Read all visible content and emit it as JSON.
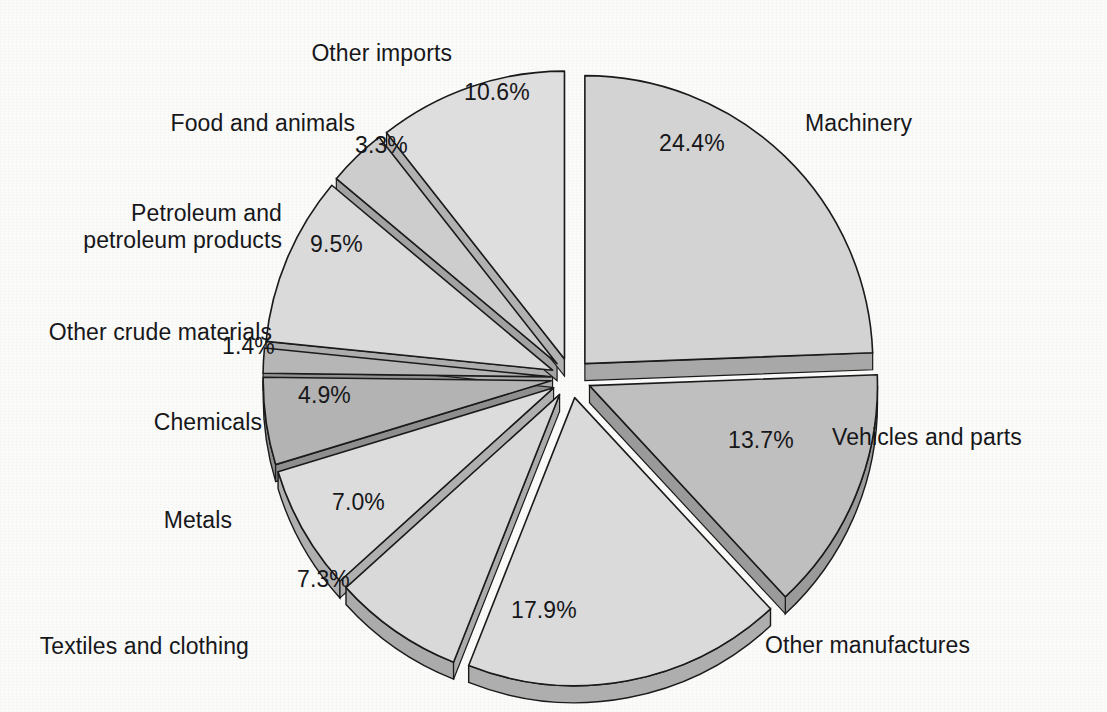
{
  "chart_data": {
    "type": "pie",
    "title": "",
    "subtitle": "",
    "xlabel": "",
    "ylabel": "",
    "units": "percent",
    "exploded": true,
    "three_d": true,
    "start_angle_deg": 0,
    "direction": "clockwise",
    "legend_position": "callout-labels",
    "grid": false,
    "total": 100.0,
    "categories": [
      "Machinery",
      "Vehicles and parts",
      "Other manufactures",
      "Textiles and clothing",
      "Metals",
      "Chemicals",
      "Other crude materials",
      "Petroleum and petroleum products",
      "Food and animals",
      "Other imports"
    ],
    "values": [
      24.4,
      13.7,
      17.9,
      7.3,
      7.0,
      4.9,
      1.4,
      9.5,
      3.3,
      10.6
    ],
    "value_labels": [
      "24.4%",
      "13.7%",
      "17.9%",
      "7.3%",
      "7.0%",
      "4.9%",
      "1.4%",
      "9.5%",
      "3.3%",
      "10.6%"
    ],
    "slice_colors": [
      "#d3d3d3",
      "#bebebe",
      "#d9d9d9",
      "#d9d9d9",
      "#d9d9d9",
      "#b4b4b4",
      "#b4b4b4",
      "#d9d9d9",
      "#cfcfcf",
      "#dcdcdc"
    ],
    "slices": [
      {
        "label": "Machinery",
        "value": 24.4,
        "value_label": "24.4%",
        "top": "#d3d3d3",
        "side": "#a8a8a8"
      },
      {
        "label": "Vehicles and parts",
        "value": 13.7,
        "value_label": "13.7%",
        "top": "#bfbfbf",
        "side": "#9a9a9a"
      },
      {
        "label": "Other manufactures",
        "value": 17.9,
        "value_label": "17.9%",
        "top": "#dadada",
        "side": "#aeaeae"
      },
      {
        "label": "Textiles and clothing",
        "value": 7.3,
        "value_label": "7.3%",
        "top": "#d9d9d9",
        "side": "#ababab"
      },
      {
        "label": "Metals",
        "value": 7.0,
        "value_label": "7.0%",
        "top": "#dcdcdc",
        "side": "#afafaf"
      },
      {
        "label": "Chemicals",
        "value": 4.9,
        "value_label": "4.9%",
        "top": "#b3b3b3",
        "side": "#8e8e8e"
      },
      {
        "label": "Other crude materials",
        "value": 1.4,
        "value_label": "1.4%",
        "top": "#b6b6b6",
        "side": "#919191"
      },
      {
        "label": "Petroleum and petroleum products",
        "value": 9.5,
        "value_label": "9.5%",
        "top": "#dadada",
        "side": "#adadad"
      },
      {
        "label": "Food and animals",
        "value": 3.3,
        "value_label": "3.3%",
        "top": "#cdcdcd",
        "side": "#a2a2a2"
      },
      {
        "label": "Other imports",
        "value": 10.6,
        "value_label": "10.6%",
        "top": "#dedede",
        "side": "#b1b1b1"
      }
    ]
  },
  "labels": {
    "machinery": "Machinery",
    "vehicles_and_parts": "Vehicles and parts",
    "other_manufactures": "Other manufactures",
    "textiles_and_clothing": "Textiles and clothing",
    "metals": "Metals",
    "chemicals": "Chemicals",
    "other_crude_materials": "Other crude materials",
    "petroleum_line1": "Petroleum and",
    "petroleum_line2": "petroleum products",
    "food_and_animals": "Food and animals",
    "other_imports": "Other imports"
  },
  "values": {
    "machinery": "24.4%",
    "vehicles_and_parts": "13.7%",
    "other_manufactures": "17.9%",
    "textiles_and_clothing": "7.3%",
    "metals": "7.0%",
    "chemicals": "4.9%",
    "other_crude_materials": "1.4%",
    "petroleum": "9.5%",
    "food_and_animals": "3.3%",
    "other_imports": "10.6%"
  },
  "colors": {
    "text": "#17171a",
    "outline": "#1a1a1a",
    "background": "#fbfbfa"
  }
}
